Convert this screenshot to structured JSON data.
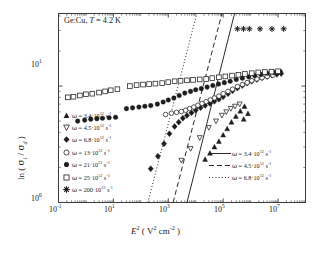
{
  "figure": {
    "annotation": "Ge:Cu, T = 4.2 K",
    "annotation_parts": {
      "material": "Ge:Cu,",
      "temp_symbol": "T",
      "temp_value": " = 4.2 K"
    }
  },
  "axes": {
    "x": {
      "label_main": "E",
      "label_sup": "2",
      "label_unit_open": " ( V",
      "label_unit_sup": "2",
      "label_unit_mid": " cm",
      "label_unit_sup2": "-2",
      "label_close": " )",
      "full_label": "E2 ( V2 cm-2 )",
      "ticks": [
        "10-1",
        "101",
        "103",
        "105",
        "107"
      ],
      "tick_mantissa": [
        "10",
        "10",
        "10",
        "10",
        "10"
      ],
      "tick_exponents": [
        "-1",
        "1",
        "3",
        "5",
        "7"
      ],
      "min_decade": -1,
      "max_decade": 8,
      "scale": "log"
    },
    "y": {
      "label_ln": "ln",
      "label_open": " ( ",
      "label_sigma_i": "s",
      "label_sub_i": "i",
      "label_slash": " / ",
      "label_sigma_d": "s",
      "label_sub_d": "d",
      "label_close": " )",
      "full_label": "ln ( si / sd )",
      "ticks": [
        "100",
        "101"
      ],
      "tick_mantissa": [
        "10",
        "10"
      ],
      "tick_exponents": [
        "0",
        "1"
      ],
      "min_decade": 0,
      "max_decade": 1.62,
      "scale": "log"
    }
  },
  "legend_symbols": {
    "items": [
      {
        "marker": "filled-triangle-up",
        "omega": "w",
        "eq": " = 3.4",
        "dot": "·",
        "base": "10",
        "exp": "12",
        "unit": "s",
        "unit_exp": "-1",
        "label": "w = 3.4·10^12 s^-1"
      },
      {
        "marker": "open-triangle-down",
        "omega": "w",
        "eq": " = 4.5",
        "dot": "·",
        "base": "10",
        "exp": "12",
        "unit": "s",
        "unit_exp": "-1",
        "label": "w = 4.5·10^12 s^-1"
      },
      {
        "marker": "filled-diamond",
        "omega": "w",
        "eq": " = 6.8",
        "dot": "·",
        "base": "10",
        "exp": "12",
        "unit": "s",
        "unit_exp": "-1",
        "label": "w = 6.8·10^12 s^-1"
      },
      {
        "marker": "open-circle",
        "omega": "w",
        "eq": " = 13",
        "dot": "·",
        "base": "10",
        "exp": "12",
        "unit": "s",
        "unit_exp": "-1",
        "label": "w = 13·10^12 s^-1"
      },
      {
        "marker": "filled-circle",
        "omega": "w",
        "eq": " = 21",
        "dot": "·",
        "base": "10",
        "exp": "12",
        "unit": "s",
        "unit_exp": "-1",
        "label": "w = 21·10^12 s^-1"
      },
      {
        "marker": "open-square",
        "omega": "w",
        "eq": " = 25",
        "dot": "·",
        "base": "10",
        "exp": "12",
        "unit": "s",
        "unit_exp": "-1",
        "label": "w = 25·10^12 s^-1"
      },
      {
        "marker": "asterisk",
        "omega": "w",
        "eq": " = 200",
        "dot": "·",
        "base": "10",
        "exp": "12",
        "unit": "s",
        "unit_exp": "-1",
        "label": "w = 200·10^12 s^-1"
      }
    ]
  },
  "legend_lines": {
    "items": [
      {
        "style": "solid",
        "omega": "w",
        "eq": " = 3.4",
        "dot": "·",
        "base": "10",
        "exp": "12",
        "unit": "s",
        "unit_exp": "-1",
        "label": "w = 3.4·10^12 s^-1"
      },
      {
        "style": "dashed",
        "omega": "w",
        "eq": " = 4.5",
        "dot": "·",
        "base": "10",
        "exp": "12",
        "unit": "s",
        "unit_exp": "-1",
        "label": "w = 4.5·10^12 s^-1"
      },
      {
        "style": "dotted",
        "omega": "w",
        "eq": " = 6.8",
        "dot": "·",
        "base": "10",
        "exp": "12",
        "unit": "s",
        "unit_exp": "-1",
        "label": "w = 6.8·10^12 s^-1"
      }
    ]
  },
  "chart_data": {
    "type": "scatter",
    "title": "Ge:Cu, T = 4.2 K",
    "xlabel": "E2 ( V2 cm-2 )",
    "ylabel": "ln ( si / sd )",
    "xlim": [
      0.1,
      100000000
    ],
    "ylim": [
      1,
      42
    ],
    "xscale": "log",
    "yscale": "log",
    "grid": false,
    "legend_position": [
      "inside-left",
      "inside-bottom-right"
    ],
    "series": [
      {
        "name": "w = 3.4·10^12 s^-1",
        "marker": "filled-triangle-up",
        "points": [
          [
            22000,
            2.35
          ],
          [
            33000,
            2.65
          ],
          [
            48000,
            3.0
          ],
          [
            70000,
            3.35
          ],
          [
            100000,
            3.8
          ],
          [
            140000,
            4.3
          ],
          [
            200000,
            4.9
          ],
          [
            290000,
            5.5
          ],
          [
            420000,
            6.1
          ],
          [
            600000,
            6.7
          ],
          [
            560000,
            5.2
          ],
          [
            800000,
            5.8
          ]
        ]
      },
      {
        "name": "w = 4.5·10^12 s^-1",
        "marker": "open-triangle-down",
        "points": [
          [
            3000,
            2.3
          ],
          [
            6500,
            2.9
          ],
          [
            14000,
            3.6
          ],
          [
            30000,
            4.4
          ],
          [
            55000,
            5.0
          ],
          [
            90000,
            5.6
          ],
          [
            130000,
            6.0
          ],
          [
            190000,
            6.4
          ],
          [
            270000,
            6.7
          ],
          [
            400000,
            7.0
          ]
        ]
      },
      {
        "name": "w = 6.8·10^12 s^-1",
        "marker": "filled-diamond",
        "points": [
          [
            230,
            1.95
          ],
          [
            420,
            2.5
          ],
          [
            700,
            3.2
          ],
          [
            1100,
            3.9
          ],
          [
            1700,
            4.5
          ],
          [
            2400,
            4.9
          ],
          [
            3400,
            5.3
          ],
          [
            4800,
            5.6
          ],
          [
            7000,
            5.9
          ],
          [
            10000,
            6.2
          ],
          [
            15000,
            6.5
          ],
          [
            22000,
            6.8
          ],
          [
            33000,
            7.1
          ],
          [
            48000,
            7.4
          ],
          [
            70000,
            7.7
          ],
          [
            100000,
            8.1
          ],
          [
            150000,
            8.6
          ],
          [
            220000,
            9.1
          ],
          [
            330000,
            9.6
          ],
          [
            500000,
            10.1
          ],
          [
            750000,
            10.6
          ],
          [
            1100000,
            11.0
          ],
          [
            1700000,
            11.4
          ],
          [
            2600000,
            11.8
          ],
          [
            4000000,
            12.1
          ],
          [
            6000000,
            12.4
          ],
          [
            9000000,
            12.6
          ],
          [
            13000000,
            12.8
          ]
        ]
      },
      {
        "name": "w = 13·10^12 s^-1",
        "marker": "open-circle",
        "points": [
          [
            800,
            5.7
          ],
          [
            1300,
            5.85
          ],
          [
            2000,
            5.95
          ],
          [
            3000,
            6.05
          ],
          [
            4300,
            6.2
          ],
          [
            6000,
            6.4
          ],
          [
            8500,
            6.6
          ],
          [
            12000,
            6.85
          ],
          [
            17000,
            7.1
          ],
          [
            24000,
            7.35
          ],
          [
            34000,
            7.6
          ],
          [
            48000,
            7.9
          ],
          [
            70000,
            8.2
          ],
          [
            100000,
            8.6
          ],
          [
            150000,
            9.0
          ],
          [
            220000,
            9.4
          ],
          [
            330000,
            9.9
          ],
          [
            500000,
            10.3
          ],
          [
            750000,
            10.7
          ],
          [
            1100000,
            11.1
          ],
          [
            1700000,
            11.5
          ],
          [
            2600000,
            11.8
          ],
          [
            4000000,
            12.1
          ],
          [
            6500000,
            12.4
          ]
        ]
      },
      {
        "name": "w = 21·10^12 s^-1",
        "marker": "filled-circle",
        "points": [
          [
            0.5,
            5.0
          ],
          [
            0.9,
            5.1
          ],
          [
            1.5,
            5.2
          ],
          [
            2.5,
            5.25
          ],
          [
            4,
            5.3
          ],
          [
            7,
            5.35
          ],
          [
            12,
            5.4
          ],
          [
            30,
            6.4
          ],
          [
            50,
            6.5
          ],
          [
            85,
            6.6
          ],
          [
            140,
            6.7
          ],
          [
            230,
            6.8
          ],
          [
            400,
            7.0
          ],
          [
            650,
            7.3
          ],
          [
            1000,
            7.6
          ],
          [
            1600,
            7.9
          ],
          [
            2500,
            8.3
          ],
          [
            4000,
            8.7
          ],
          [
            6500,
            9.0
          ],
          [
            10000,
            9.3
          ],
          [
            16000,
            9.5
          ],
          [
            26000,
            9.8
          ],
          [
            42000,
            10.1
          ],
          [
            68000,
            10.4
          ],
          [
            110000,
            10.7
          ],
          [
            180000,
            11.0
          ],
          [
            300000,
            11.4
          ],
          [
            500000,
            11.7
          ],
          [
            850000,
            12.0
          ],
          [
            1400000,
            12.3
          ],
          [
            2400000,
            12.6
          ],
          [
            4000000,
            12.9
          ],
          [
            7000000,
            13.1
          ],
          [
            12000000,
            13.3
          ]
        ]
      },
      {
        "name": "w = 25·10^12 s^-1",
        "marker": "open-square",
        "points": [
          [
            0.22,
            8.0
          ],
          [
            0.35,
            8.1
          ],
          [
            0.6,
            8.3
          ],
          [
            1.0,
            8.5
          ],
          [
            1.7,
            8.6
          ],
          [
            3,
            8.8
          ],
          [
            5,
            9.0
          ],
          [
            8,
            9.2
          ],
          [
            14,
            9.4
          ],
          [
            40,
            10.0
          ],
          [
            70,
            10.2
          ],
          [
            120,
            10.3
          ],
          [
            200,
            10.4
          ],
          [
            340,
            10.5
          ],
          [
            600,
            10.6
          ],
          [
            1000,
            10.8
          ],
          [
            1700,
            11.0
          ],
          [
            2800,
            11.1
          ],
          [
            4800,
            11.2
          ],
          [
            8000,
            11.3
          ],
          [
            14000,
            11.4
          ],
          [
            24000,
            11.5
          ],
          [
            40000,
            11.7
          ],
          [
            70000,
            11.9
          ],
          [
            120000,
            12.1
          ],
          [
            210000,
            12.3
          ],
          [
            360000,
            12.5
          ],
          [
            620000,
            12.7
          ],
          [
            1100000,
            12.9
          ],
          [
            1900000,
            13.1
          ],
          [
            3300000,
            13.2
          ],
          [
            5800000,
            13.3
          ],
          [
            10000000,
            13.4
          ]
        ]
      },
      {
        "name": "w = 200·10^12 s^-1",
        "marker": "asterisk",
        "points": [
          [
            330000,
            31
          ],
          [
            550000,
            31
          ],
          [
            900000,
            31
          ],
          [
            2200000,
            31
          ],
          [
            6000000,
            31
          ],
          [
            16000000,
            31
          ]
        ]
      }
    ],
    "fit_lines": [
      {
        "name": "w = 3.4·10^12 s^-1",
        "style": "solid",
        "x_at_ymin": 4800,
        "x_at_ymax": 260000
      },
      {
        "name": "w = 4.5·10^12 s^-1",
        "style": "dashed",
        "x_at_ymin": 1500,
        "x_at_ymax": 90000
      },
      {
        "name": "w = 6.8·10^12 s^-1",
        "style": "dotted",
        "x_at_ymin": 180,
        "x_at_ymax": 11000
      }
    ]
  }
}
